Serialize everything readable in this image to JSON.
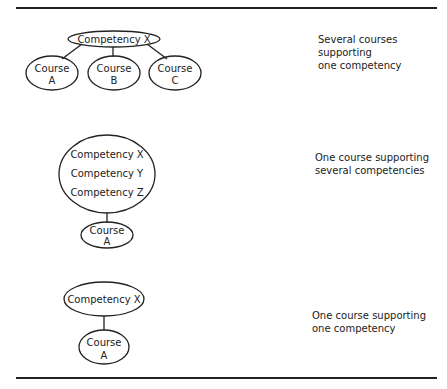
{
  "rows": [
    {
      "diagram": {
        "competency": "Competency X",
        "courses": [
          {
            "line1": "Course",
            "line2": "A"
          },
          {
            "line1": "Course",
            "line2": "B"
          },
          {
            "line1": "Course",
            "line2": "C"
          }
        ]
      },
      "caption": [
        "Several courses",
        "supporting",
        "one competency"
      ]
    },
    {
      "diagram": {
        "competencies": [
          "Competency X",
          "Competency Y",
          "Competency Z"
        ],
        "course": {
          "line1": "Course",
          "line2": "A"
        }
      },
      "caption": [
        "One course supporting",
        "several competencies"
      ]
    },
    {
      "diagram": {
        "competency": "Competency X",
        "course": {
          "line1": "Course",
          "line2": "A"
        }
      },
      "caption": [
        "One course supporting",
        "one competency"
      ]
    }
  ]
}
